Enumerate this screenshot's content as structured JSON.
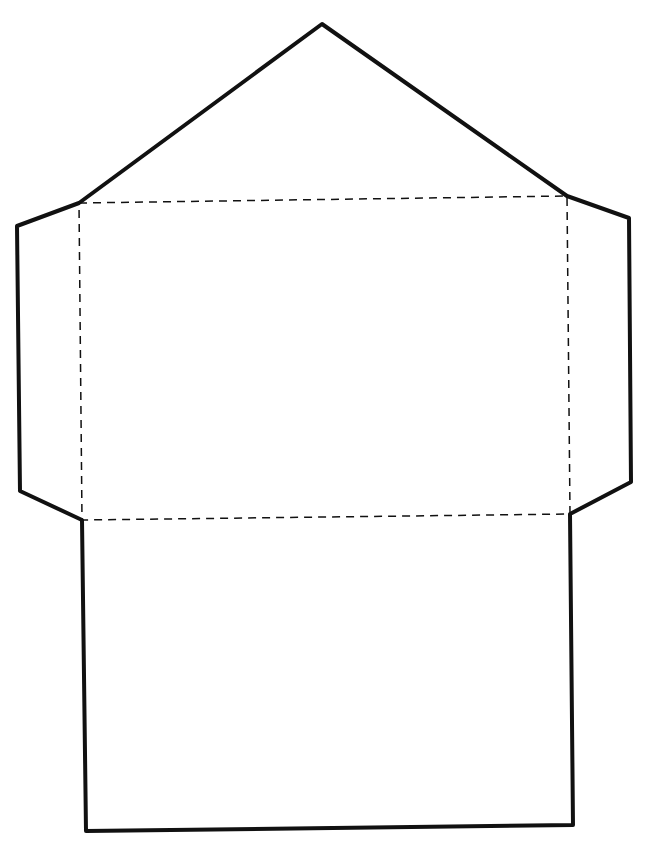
{
  "diagram": {
    "type": "envelope-template",
    "background": "#ffffff",
    "stroke_color": "#111111",
    "cut_line": {
      "style": "solid",
      "width": 4,
      "points": [
        [
          322,
          24
        ],
        [
          567,
          196
        ],
        [
          629,
          218
        ],
        [
          631,
          482
        ],
        [
          570,
          514
        ],
        [
          573,
          825
        ],
        [
          86,
          831
        ],
        [
          82,
          520
        ],
        [
          20,
          491
        ],
        [
          17,
          226
        ],
        [
          79,
          203
        ]
      ]
    },
    "fold_line": {
      "style": "dashed",
      "width": 1.5,
      "rect": [
        [
          79,
          203
        ],
        [
          567,
          196
        ],
        [
          570,
          514
        ],
        [
          82,
          520
        ]
      ]
    },
    "labels": []
  }
}
